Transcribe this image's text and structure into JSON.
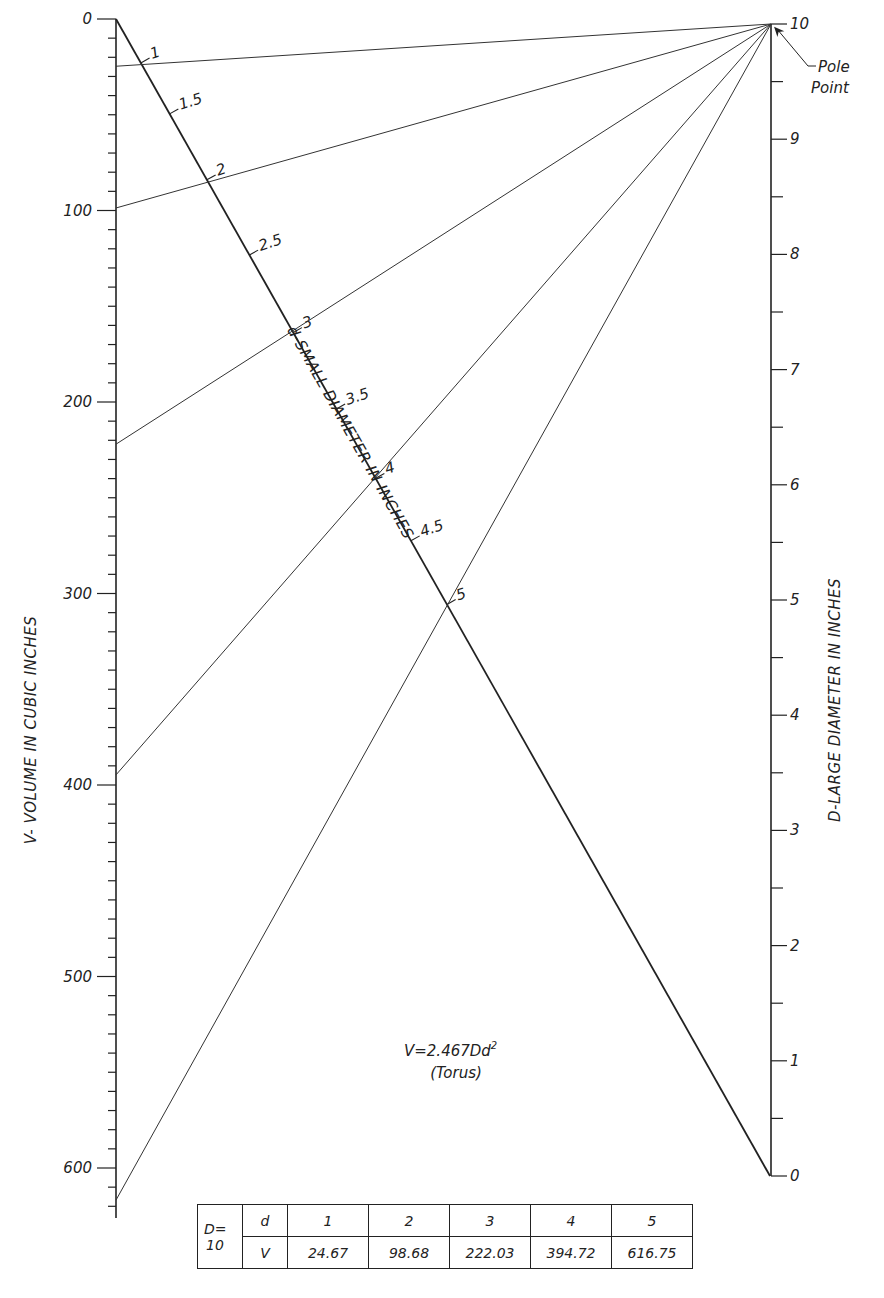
{
  "chart_data": {
    "type": "nomogram",
    "formula": "V=2.467Dd",
    "formula_exponent": "2",
    "formula_subtitle": "(Torus)",
    "left_axis": {
      "label": "V- VOLUME IN CUBIC INCHES",
      "range": [
        0,
        625
      ],
      "major_ticks": [
        0,
        100,
        200,
        300,
        400,
        500,
        600
      ],
      "major_labels": [
        "0",
        "100",
        "200",
        "300",
        "400",
        "500",
        "600"
      ],
      "minor_step": 10
    },
    "right_axis": {
      "label": "D-LARGE DIAMETER IN INCHES",
      "range": [
        0,
        10
      ],
      "major_ticks": [
        0,
        1,
        2,
        3,
        4,
        5,
        6,
        7,
        8,
        9,
        10
      ],
      "major_labels": [
        "0",
        "1",
        "2",
        "3",
        "4",
        "5",
        "6",
        "7",
        "8",
        "9",
        "10"
      ],
      "minor_step": 0.5
    },
    "diagonal_axis": {
      "label": "d-SMALL DIAMETER IN INCHES",
      "ticks": [
        1,
        1.5,
        2,
        2.5,
        3,
        3.5,
        4,
        4.5,
        5
      ],
      "tick_labels": [
        "1",
        "1.5",
        "2",
        "2.5",
        "3",
        "3.5",
        "4",
        "4.5",
        "5"
      ]
    },
    "pole_point": {
      "label_line1": "Pole",
      "label_line2": "Point",
      "D": 10
    },
    "isopleths": [
      {
        "D": 10,
        "d": 1,
        "V": 24.67
      },
      {
        "D": 10,
        "d": 2,
        "V": 98.68
      },
      {
        "D": 10,
        "d": 3,
        "V": 222.03
      },
      {
        "D": 10,
        "d": 4,
        "V": 394.72
      },
      {
        "D": 10,
        "d": 5,
        "V": 616.75
      }
    ],
    "table": {
      "D_label": "D=",
      "D_value": "10",
      "row_d_label": "d",
      "row_v_label": "V",
      "d_values": [
        "1",
        "2",
        "3",
        "4",
        "5"
      ],
      "v_values": [
        "24.67",
        "98.68",
        "222.03",
        "394.72",
        "616.75"
      ]
    }
  }
}
